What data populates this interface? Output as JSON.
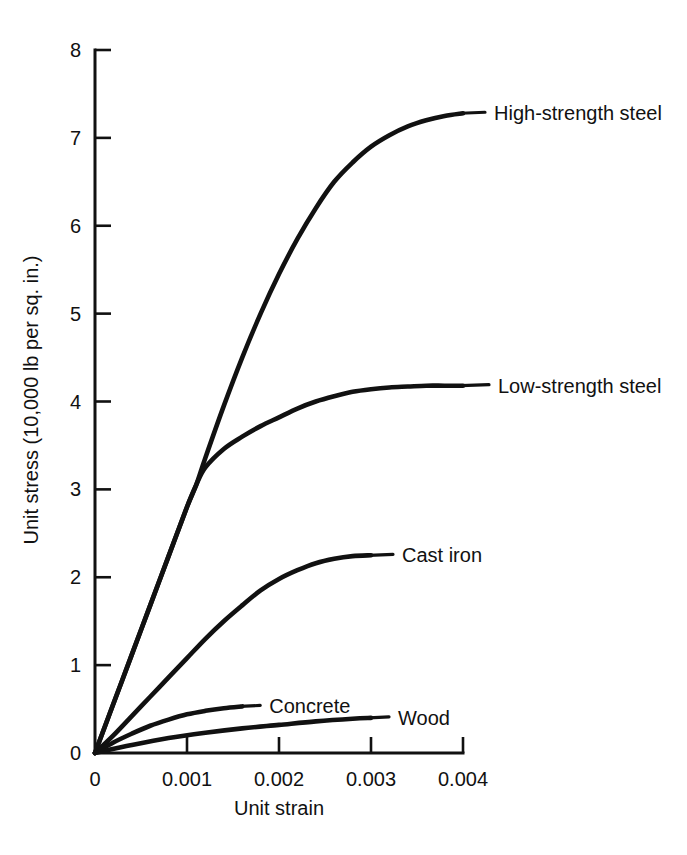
{
  "chart_data": {
    "type": "line",
    "title": "",
    "xlabel": "Unit strain",
    "ylabel": "Unit stress (10,000 lb per sq. in.)",
    "xlim": [
      0,
      0.004
    ],
    "ylim": [
      0,
      8
    ],
    "xticks": [
      0,
      0.001,
      0.002,
      0.003,
      0.004
    ],
    "xtick_labels": [
      "0",
      "0.001",
      "0.002",
      "0.003",
      "0.004"
    ],
    "yticks": [
      0,
      1,
      2,
      3,
      4,
      5,
      6,
      7,
      8
    ],
    "ytick_labels": [
      "0",
      "1",
      "2",
      "3",
      "4",
      "5",
      "6",
      "7",
      "8"
    ],
    "grid": false,
    "legend_position": "inline-end-labels",
    "line_color": "#111111",
    "background_color": "#ffffff",
    "series": [
      {
        "name": "High-strength steel",
        "label": "High-strength steel",
        "x": [
          0.0,
          0.0002,
          0.0004,
          0.0006,
          0.0008,
          0.001,
          0.0011,
          0.0012,
          0.0014,
          0.0016,
          0.0018,
          0.002,
          0.0022,
          0.0024,
          0.0026,
          0.0028,
          0.003,
          0.0032,
          0.0034,
          0.0036,
          0.0038,
          0.004
        ],
        "y": [
          0.0,
          0.56,
          1.12,
          1.68,
          2.24,
          2.8,
          3.05,
          3.36,
          3.95,
          4.5,
          5.0,
          5.45,
          5.85,
          6.2,
          6.5,
          6.72,
          6.9,
          7.03,
          7.13,
          7.2,
          7.25,
          7.28
        ]
      },
      {
        "name": "Low-strength steel",
        "label": "Low-strength steel",
        "x": [
          0.0,
          0.0002,
          0.0004,
          0.0006,
          0.0008,
          0.001,
          0.0011,
          0.0012,
          0.0014,
          0.0016,
          0.0018,
          0.002,
          0.0022,
          0.0024,
          0.0026,
          0.0028,
          0.003,
          0.0032,
          0.0034,
          0.0036,
          0.0038,
          0.004
        ],
        "y": [
          0.0,
          0.56,
          1.12,
          1.68,
          2.24,
          2.8,
          3.05,
          3.25,
          3.46,
          3.6,
          3.72,
          3.82,
          3.92,
          4.0,
          4.06,
          4.11,
          4.14,
          4.16,
          4.17,
          4.18,
          4.18,
          4.18
        ]
      },
      {
        "name": "Cast iron",
        "label": "Cast iron",
        "x": [
          0.0,
          0.0002,
          0.0004,
          0.0006,
          0.0008,
          0.001,
          0.0012,
          0.0014,
          0.0016,
          0.0018,
          0.002,
          0.0022,
          0.0024,
          0.0026,
          0.0028,
          0.003
        ],
        "y": [
          0.0,
          0.2,
          0.42,
          0.64,
          0.86,
          1.08,
          1.3,
          1.5,
          1.68,
          1.85,
          1.98,
          2.08,
          2.16,
          2.21,
          2.24,
          2.25
        ]
      },
      {
        "name": "Concrete",
        "label": "Concrete",
        "x": [
          0.0,
          0.0002,
          0.0004,
          0.0006,
          0.0008,
          0.001,
          0.0012,
          0.0014,
          0.0016
        ],
        "y": [
          0.0,
          0.12,
          0.22,
          0.31,
          0.38,
          0.44,
          0.48,
          0.51,
          0.53
        ]
      },
      {
        "name": "Wood",
        "label": "Wood",
        "x": [
          0.0,
          0.0004,
          0.0008,
          0.0012,
          0.0016,
          0.002,
          0.0024,
          0.0028,
          0.003
        ],
        "y": [
          0.0,
          0.09,
          0.17,
          0.23,
          0.28,
          0.32,
          0.36,
          0.39,
          0.4
        ]
      }
    ],
    "annotations": [
      {
        "text": "High-strength steel",
        "series": "High-strength steel",
        "anchor_x": 0.004,
        "anchor_y": 7.28
      },
      {
        "text": "Low-strength steel",
        "series": "Low-strength steel",
        "anchor_x": 0.004,
        "anchor_y": 4.18
      },
      {
        "text": "Cast iron",
        "series": "Cast iron",
        "anchor_x": 0.003,
        "anchor_y": 2.25
      },
      {
        "text": "Concrete",
        "series": "Concrete",
        "anchor_x": 0.0016,
        "anchor_y": 0.53
      },
      {
        "text": "Wood",
        "series": "Wood",
        "anchor_x": 0.003,
        "anchor_y": 0.4
      }
    ]
  }
}
